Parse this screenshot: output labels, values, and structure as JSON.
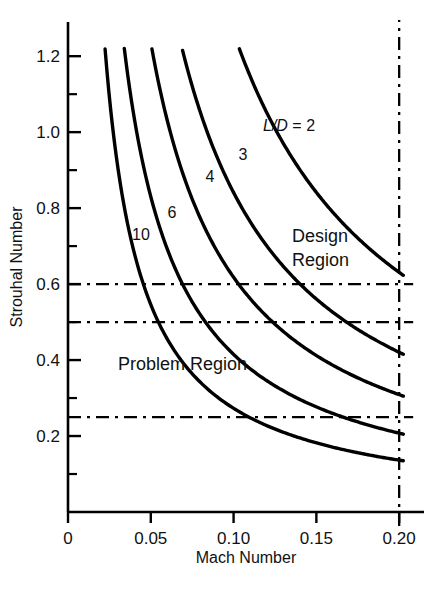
{
  "chart_data": {
    "type": "line",
    "title": "",
    "xlabel": "Mach Number",
    "ylabel": "Strouhal Number",
    "xlim": [
      0,
      0.215
    ],
    "ylim": [
      0,
      1.29
    ],
    "grid": false,
    "legend": "inline-curve-labels",
    "x_ticks_major": [
      {
        "value": 0,
        "label": "0"
      },
      {
        "value": 0.05,
        "label": "0.05"
      },
      {
        "value": 0.1,
        "label": "0.10"
      },
      {
        "value": 0.15,
        "label": "0.15"
      },
      {
        "value": 0.2,
        "label": "0.20"
      }
    ],
    "y_ticks_major": [
      {
        "value": 0.2,
        "label": "0.2"
      },
      {
        "value": 0.4,
        "label": "0.4"
      },
      {
        "value": 0.6,
        "label": "0.6"
      },
      {
        "value": 0.8,
        "label": "0.8"
      },
      {
        "value": 1.0,
        "label": "1.0"
      },
      {
        "value": 1.2,
        "label": "1.2"
      }
    ],
    "y_ticks_minor": [
      0.1,
      0.3,
      0.5,
      0.7,
      0.9,
      1.1
    ],
    "series": [
      {
        "name": "L/D = 2",
        "label": "L/D = 2",
        "label_prefix": "L/D",
        "label_suffix": " = 2",
        "ld": 2,
        "k": 0.1262,
        "x_start": 0.1035,
        "x_end": 0.2025,
        "y_at_x_end": 0.63,
        "points": [
          {
            "x": 0.1035,
            "y": 1.22
          },
          {
            "x": 0.12,
            "y": 1.052
          },
          {
            "x": 0.14,
            "y": 0.901
          },
          {
            "x": 0.16,
            "y": 0.789
          },
          {
            "x": 0.18,
            "y": 0.701
          },
          {
            "x": 0.2025,
            "y": 0.63
          }
        ]
      },
      {
        "name": "3",
        "label": "3",
        "ld": 3,
        "k": 0.0841,
        "x_start": 0.0692,
        "x_end": 0.2025,
        "y_at_x_end": 0.415,
        "points": [
          {
            "x": 0.0692,
            "y": 1.22
          },
          {
            "x": 0.09,
            "y": 0.934
          },
          {
            "x": 0.11,
            "y": 0.765
          },
          {
            "x": 0.14,
            "y": 0.601
          },
          {
            "x": 0.17,
            "y": 0.495
          },
          {
            "x": 0.2025,
            "y": 0.415
          }
        ]
      },
      {
        "name": "4",
        "label": "4",
        "ld": 4,
        "k": 0.0618,
        "x_start": 0.0507,
        "x_end": 0.2025,
        "y_at_x_end": 0.305,
        "points": [
          {
            "x": 0.0507,
            "y": 1.22
          },
          {
            "x": 0.07,
            "y": 0.883
          },
          {
            "x": 0.09,
            "y": 0.687
          },
          {
            "x": 0.12,
            "y": 0.515
          },
          {
            "x": 0.16,
            "y": 0.386
          },
          {
            "x": 0.2025,
            "y": 0.305
          }
        ]
      },
      {
        "name": "6",
        "label": "6",
        "ld": 6,
        "k": 0.0415,
        "x_start": 0.034,
        "x_end": 0.2025,
        "y_at_x_end": 0.205,
        "points": [
          {
            "x": 0.034,
            "y": 1.22
          },
          {
            "x": 0.05,
            "y": 0.83
          },
          {
            "x": 0.07,
            "y": 0.593
          },
          {
            "x": 0.1,
            "y": 0.415
          },
          {
            "x": 0.14,
            "y": 0.296
          },
          {
            "x": 0.2025,
            "y": 0.205
          }
        ]
      },
      {
        "name": "10",
        "label": "10",
        "ld": 10,
        "k": 0.0273,
        "x_start": 0.0224,
        "x_end": 0.2025,
        "y_at_x_end": 0.135,
        "points": [
          {
            "x": 0.0224,
            "y": 1.22
          },
          {
            "x": 0.035,
            "y": 0.78
          },
          {
            "x": 0.05,
            "y": 0.546
          },
          {
            "x": 0.08,
            "y": 0.341
          },
          {
            "x": 0.13,
            "y": 0.21
          },
          {
            "x": 0.2025,
            "y": 0.135
          }
        ]
      }
    ],
    "reference_lines": [
      {
        "name": "upper-threshold",
        "orientation": "horizontal",
        "value": 0.6,
        "style": "dash-dot"
      },
      {
        "name": "mid-threshold",
        "orientation": "horizontal",
        "value": 0.5,
        "style": "dash-dot"
      },
      {
        "name": "lower-threshold",
        "orientation": "horizontal",
        "value": 0.25,
        "style": "dash-dot"
      },
      {
        "name": "mach-limit",
        "orientation": "vertical",
        "value": 0.2,
        "style": "dash-dot"
      }
    ],
    "annotations": [
      {
        "name": "design-region",
        "text_line1": "Design",
        "text_line2": "Region",
        "x": 0.158,
        "y": 0.71
      },
      {
        "name": "problem-region",
        "text": "Problem Region",
        "x": 0.044,
        "y": 0.4
      }
    ]
  },
  "axes": {
    "x_title": "Mach Number",
    "y_title": "Strouhal Number"
  },
  "annotations": {
    "design_region_line1": "Design",
    "design_region_line2": "Region",
    "problem_region": "Problem Region"
  },
  "curve_labels": {
    "ld2_prefix": "L/D",
    "ld2_suffix": " = 2",
    "ld3": "3",
    "ld4": "4",
    "ld6": "6",
    "ld10": "10"
  },
  "x_tick_labels": {
    "t0": "0",
    "t1": "0.05",
    "t2": "0.10",
    "t3": "0.15",
    "t4": "0.20"
  },
  "y_tick_labels": {
    "t02": "0.2",
    "t04": "0.4",
    "t06": "0.6",
    "t08": "0.8",
    "t10": "1.0",
    "t12": "1.2"
  },
  "colors": {
    "line": "#000000",
    "text": "#111111",
    "background": "#ffffff"
  }
}
